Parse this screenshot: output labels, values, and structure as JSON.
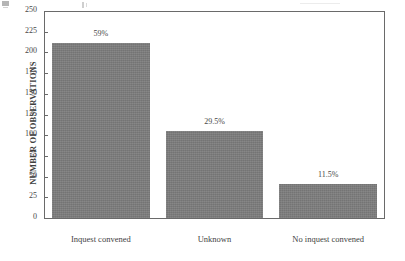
{
  "chart_data": {
    "type": "bar",
    "title": "",
    "subtitle": "",
    "xlabel": "",
    "ylabel": "NUMBER OF OBSERVATIONS",
    "ylim": [
      0,
      250
    ],
    "yticks": [
      0,
      25,
      50,
      75,
      100,
      125,
      150,
      175,
      200,
      225,
      250
    ],
    "ytick_labels": [
      "0",
      "25",
      "50",
      "75",
      "100",
      "125",
      "150",
      "175",
      "200",
      "225",
      "250"
    ],
    "grid": false,
    "legend": false,
    "legend_position": "none",
    "categories": [
      "Inquest convened",
      "Unknown",
      "No inquest convened"
    ],
    "values": [
      211,
      105,
      41
    ],
    "data_labels": [
      "59%",
      "29.5%",
      "11.5%"
    ],
    "percentages": [
      59,
      29.5,
      11.5
    ],
    "bar_color": "#7d7d7d",
    "axis_color": "#6a6a6a",
    "background": "#ffffff"
  },
  "axes": {
    "y_title": "NUMBER OF OBSERVATIONS"
  }
}
